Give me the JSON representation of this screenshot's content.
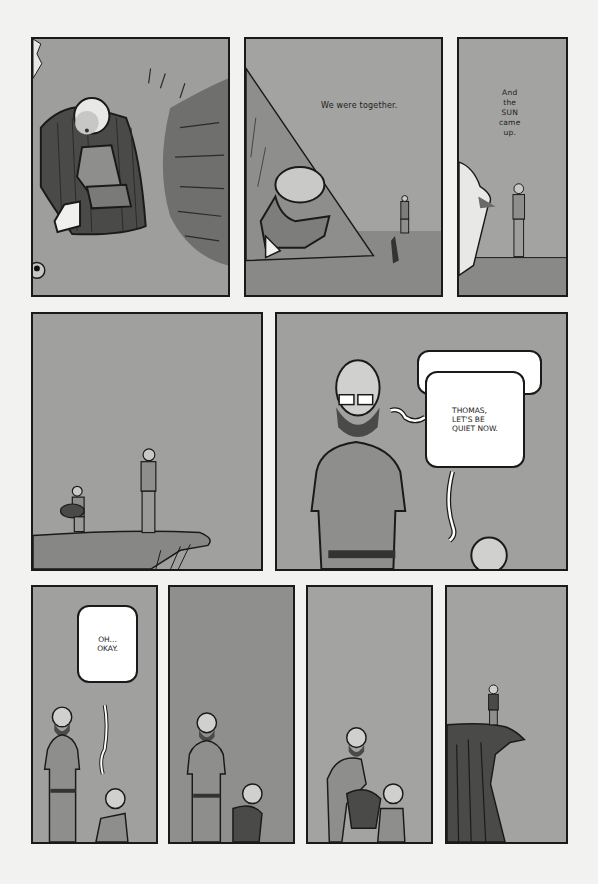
{
  "page": {
    "type": "comic-page",
    "background": "#f2f2f0",
    "panel_fill": "#9d9d9b",
    "ink": "#1a1a1a"
  },
  "panels": [
    {
      "id": 1,
      "description": "Child in a striped cloak sitting, rubbing eye, grass beside",
      "caption": ""
    },
    {
      "id": 2,
      "description": "Child crawling out of a tent, father standing in distance",
      "caption": "We were together."
    },
    {
      "id": 3,
      "description": "Father standing on horizon, edge of tent in foreground",
      "caption": "And\nthe\nSUN\ncame\nup."
    },
    {
      "id": 4,
      "description": "Child carrying sleeping bag toward father at cliff edge",
      "caption": ""
    },
    {
      "id": 5,
      "description": "Bearded father close-up, child looking up",
      "bubbles": [
        {
          "speaker": "child",
          "text": "HEY DAD, MAYBE WE",
          "partially_covered": true
        },
        {
          "speaker": "father",
          "text": "THOMAS,\nLET'S BE\nQUIET NOW."
        }
      ]
    },
    {
      "id": 6,
      "description": "Father and child standing",
      "bubbles": [
        {
          "speaker": "child",
          "text": "OH...\nOKAY."
        }
      ]
    },
    {
      "id": 7,
      "description": "Father looks down at child holding bundle",
      "caption": ""
    },
    {
      "id": 8,
      "description": "Father takes bundle from child",
      "caption": ""
    },
    {
      "id": 9,
      "description": "Lone figure standing on cliff edge",
      "caption": ""
    }
  ]
}
